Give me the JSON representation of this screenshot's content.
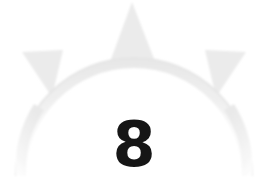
{
  "page": {
    "background_color": "#ffffff",
    "width": 268,
    "height": 195
  },
  "ornament": {
    "name": "spiked-arc-ornament",
    "description": "faded light-gray spiked semicircular arc (sun/crown motif)",
    "fill_color": "#ebebeb",
    "edge_color": "#e2e2e2",
    "arc": {
      "center_x": 134,
      "center_y": 172,
      "outer_radius": 118,
      "inner_radius": 108,
      "start_angle_deg": 182,
      "end_angle_deg": 358
    },
    "spikes": [
      {
        "name": "spike-left",
        "tip_x": 22,
        "tip_y": 52,
        "base_angle_deg": 208
      },
      {
        "name": "spike-top",
        "tip_x": 132,
        "tip_y": 2,
        "base_angle_deg": 268
      },
      {
        "name": "spike-right",
        "tip_x": 246,
        "tip_y": 52,
        "base_angle_deg": 330
      }
    ]
  },
  "page_number": {
    "label": "8",
    "color": "#161616"
  }
}
